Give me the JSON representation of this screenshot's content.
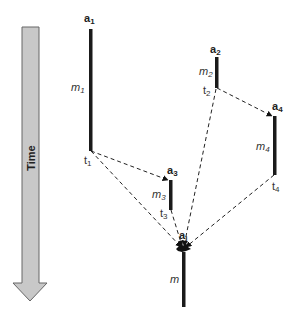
{
  "diagram": {
    "time_axis": {
      "label": "Time",
      "fill": "#c8c8c8",
      "stroke": "#666666"
    },
    "agents": [
      {
        "id": "a1",
        "name": "a",
        "sub": "1",
        "message": "m",
        "message_sub": "1",
        "time": "t",
        "time_sub": "1"
      },
      {
        "id": "a2",
        "name": "a",
        "sub": "2",
        "message": "m",
        "message_sub": "2",
        "time": "t",
        "time_sub": "2"
      },
      {
        "id": "a3",
        "name": "a",
        "sub": "3",
        "message": "m",
        "message_sub": "3",
        "time": "t",
        "time_sub": "3"
      },
      {
        "id": "a4",
        "name": "a",
        "sub": "4",
        "message": "m",
        "message_sub": "4",
        "time": "t",
        "time_sub": "4"
      },
      {
        "id": "ai",
        "name": "a",
        "sub": "i",
        "message": "m",
        "message_sub": ""
      }
    ],
    "edges": [
      {
        "from": "t1",
        "to": "a3"
      },
      {
        "from": "t1",
        "to": "ai"
      },
      {
        "from": "t2",
        "to": "a4"
      },
      {
        "from": "t2",
        "to": "ai"
      },
      {
        "from": "t3",
        "to": "ai"
      },
      {
        "from": "t4",
        "to": "ai"
      }
    ],
    "colors": {
      "bar": "#1a1a1a",
      "dashed": "#222222"
    }
  }
}
